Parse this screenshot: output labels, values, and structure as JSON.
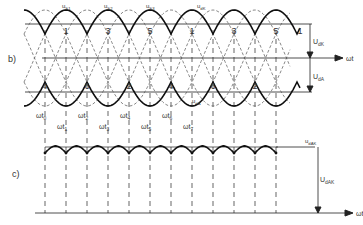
{
  "figure": {
    "panel_b_label": "b)",
    "panel_c_label": "c)",
    "axis_label": "ωt",
    "phase_labels_top": [
      {
        "name": "u",
        "sub": "S1"
      },
      {
        "name": "u",
        "sub": "S2"
      },
      {
        "name": "u",
        "sub": "S3"
      },
      {
        "name": "u",
        "sub": "dK"
      }
    ],
    "lower_curve_label": {
      "name": "u",
      "sub": "dA"
    },
    "top_segment_numbers": [
      "1",
      "3",
      "5",
      "1",
      "3",
      "5",
      "1"
    ],
    "bottom_segment_numbers": [
      "4",
      "6",
      "2",
      "4",
      "6",
      "2",
      "4"
    ],
    "dimension_labels": {
      "upper": {
        "name": "U",
        "sub": "dK"
      },
      "lower": {
        "name": "U",
        "sub": "dA"
      },
      "total": {
        "name": "U",
        "sub": "dAK"
      },
      "ripple": {
        "name": "u",
        "sub": "dAK"
      }
    },
    "time_marks": [
      {
        "name": "ωt",
        "sub": "0"
      },
      {
        "name": "ωt",
        "sub": "1"
      },
      {
        "name": "ωt",
        "sub": "2"
      },
      {
        "name": "ωt",
        "sub": "3"
      },
      {
        "name": "ωt",
        "sub": "4"
      },
      {
        "name": "ωt",
        "sub": "5"
      },
      {
        "name": "ωt",
        "sub": "6"
      },
      {
        "name": "ωt",
        "sub": "7"
      }
    ],
    "colors": {
      "line": "#1a1a1a",
      "text": "#333333",
      "background": "#ffffff"
    }
  }
}
